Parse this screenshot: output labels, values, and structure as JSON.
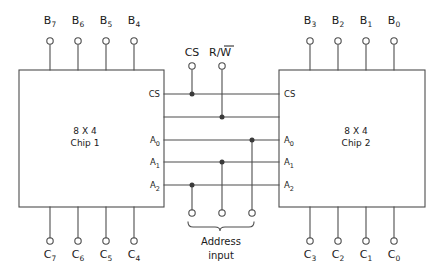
{
  "diagram": {
    "stroke_color": "#4d4d4d",
    "text_color": "#1a1a1a",
    "background": "#ffffff"
  },
  "chips": [
    {
      "id": "chip1",
      "size_label": "8 X 4",
      "name_label": "Chip 1"
    },
    {
      "id": "chip2",
      "size_label": "8 X 4",
      "name_label": "Chip 2"
    }
  ],
  "data_inputs_left": [
    {
      "base": "B",
      "sub": "7"
    },
    {
      "base": "B",
      "sub": "6"
    },
    {
      "base": "B",
      "sub": "5"
    },
    {
      "base": "B",
      "sub": "4"
    }
  ],
  "data_inputs_right": [
    {
      "base": "B",
      "sub": "3"
    },
    {
      "base": "B",
      "sub": "2"
    },
    {
      "base": "B",
      "sub": "1"
    },
    {
      "base": "B",
      "sub": "0"
    }
  ],
  "data_outputs_left": [
    {
      "base": "C",
      "sub": "7"
    },
    {
      "base": "C",
      "sub": "6"
    },
    {
      "base": "C",
      "sub": "5"
    },
    {
      "base": "C",
      "sub": "4"
    }
  ],
  "data_outputs_right": [
    {
      "base": "C",
      "sub": "3"
    },
    {
      "base": "C",
      "sub": "2"
    },
    {
      "base": "C",
      "sub": "1"
    },
    {
      "base": "C",
      "sub": "0"
    }
  ],
  "control_inputs": [
    {
      "id": "cs",
      "label": "CS",
      "overline": false
    },
    {
      "id": "rw",
      "label_pre": "R/",
      "label_bar": "W",
      "overline": true
    }
  ],
  "chip1_pins": [
    {
      "id": "cs",
      "base": "CS",
      "sub": ""
    },
    {
      "id": "a0",
      "base": "A",
      "sub": "0"
    },
    {
      "id": "a1",
      "base": "A",
      "sub": "1"
    },
    {
      "id": "a2",
      "base": "A",
      "sub": "2"
    }
  ],
  "chip2_pins": [
    {
      "id": "cs",
      "base": "CS",
      "sub": ""
    },
    {
      "id": "a0",
      "base": "A",
      "sub": "0"
    },
    {
      "id": "a1",
      "base": "A",
      "sub": "1"
    },
    {
      "id": "a2",
      "base": "A",
      "sub": "2"
    }
  ],
  "address_bus": {
    "caption_line1": "Address",
    "caption_line2": "input",
    "terminals": [
      "a2-terminal",
      "a1-terminal",
      "a0-terminal"
    ]
  }
}
